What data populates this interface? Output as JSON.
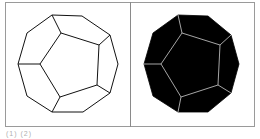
{
  "figure": {
    "panels": [
      {
        "label": "dodecahedron-wireframe",
        "fill": "#ffffff",
        "stroke": "#111111"
      },
      {
        "label": "dodecahedron-solid",
        "fill": "#000000",
        "stroke": "#cfcfcf"
      }
    ],
    "caption": "(1) (2)"
  }
}
